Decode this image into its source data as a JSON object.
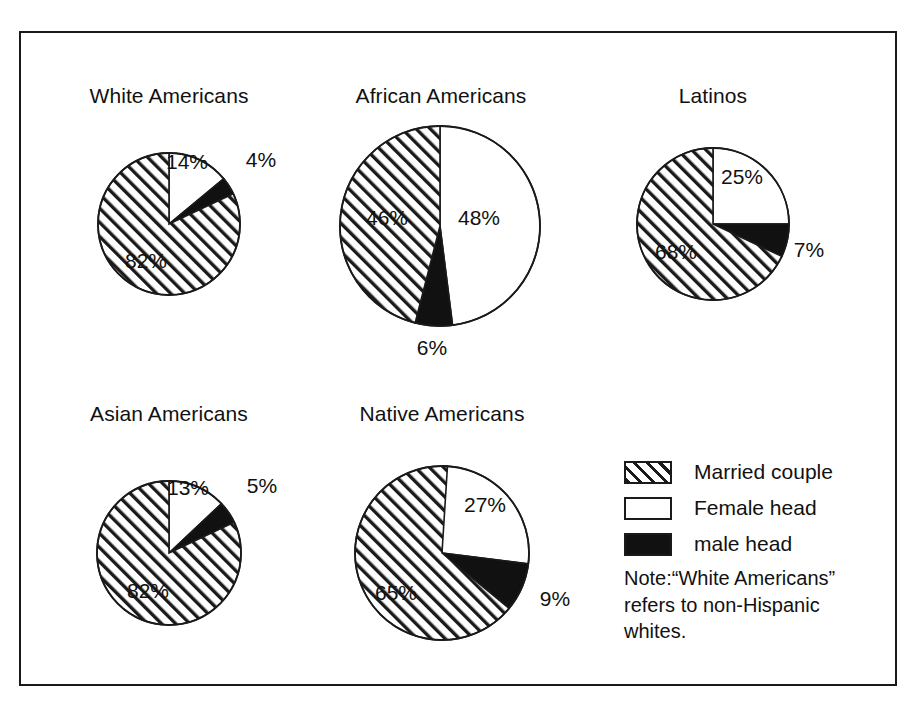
{
  "figure": {
    "background_color": "#ffffff",
    "frame_color": "#1a1a1a"
  },
  "legend": {
    "items": [
      {
        "label": "Married couple",
        "swatch": "hatch",
        "color": "#ffffff"
      },
      {
        "label": "Female head",
        "swatch": "white",
        "color": "#ffffff"
      },
      {
        "label": "male head",
        "swatch": "black",
        "color": "#111111"
      }
    ]
  },
  "note": {
    "text": "Note:“White Americans” refers to non-Hispanic whites."
  },
  "chart_data": {
    "type": "pie",
    "categories": [
      "Married couple",
      "Female head",
      "male head"
    ],
    "legend_position": "bottom-right",
    "units": "percent",
    "charts": [
      {
        "title": "White Americans",
        "values": [
          82,
          14,
          4
        ],
        "labels": [
          "82%",
          "14%",
          "4%"
        ],
        "slices": [
          {
            "name": "Female head",
            "value": 14,
            "label": "14%",
            "fill": "white"
          },
          {
            "name": "male head",
            "value": 4,
            "label": "4%",
            "fill": "black"
          },
          {
            "name": "Married couple",
            "value": 82,
            "label": "82%",
            "fill": "hatch"
          }
        ]
      },
      {
        "title": "African Americans",
        "values": [
          46,
          48,
          6
        ],
        "labels": [
          "46%",
          "48%",
          "6%"
        ],
        "slices": [
          {
            "name": "Female head",
            "value": 48,
            "label": "48%",
            "fill": "white"
          },
          {
            "name": "male head",
            "value": 6,
            "label": "6%",
            "fill": "black"
          },
          {
            "name": "Married couple",
            "value": 46,
            "label": "46%",
            "fill": "hatch"
          }
        ]
      },
      {
        "title": "Latinos",
        "values": [
          68,
          25,
          7
        ],
        "labels": [
          "68%",
          "25%",
          "7%"
        ],
        "slices": [
          {
            "name": "Female head",
            "value": 25,
            "label": "25%",
            "fill": "white"
          },
          {
            "name": "male head",
            "value": 7,
            "label": "7%",
            "fill": "black"
          },
          {
            "name": "Married couple",
            "value": 68,
            "label": "68%",
            "fill": "hatch"
          }
        ]
      },
      {
        "title": "Asian Americans",
        "values": [
          82,
          13,
          5
        ],
        "labels": [
          "82%",
          "13%",
          "5%"
        ],
        "slices": [
          {
            "name": "Female head",
            "value": 13,
            "label": "13%",
            "fill": "white"
          },
          {
            "name": "male head",
            "value": 5,
            "label": "5%",
            "fill": "black"
          },
          {
            "name": "Married couple",
            "value": 82,
            "label": "82%",
            "fill": "hatch"
          }
        ]
      },
      {
        "title": "Native Americans",
        "values": [
          65,
          27,
          9
        ],
        "labels": [
          "65%",
          "27%",
          "9%"
        ],
        "slices": [
          {
            "name": "Female head",
            "value": 27,
            "label": "27%",
            "fill": "white"
          },
          {
            "name": "male head",
            "value": 9,
            "label": "9%",
            "fill": "black"
          },
          {
            "name": "Married couple",
            "value": 65,
            "label": "65%",
            "fill": "hatch"
          }
        ]
      }
    ]
  },
  "layout": {
    "pies": [
      {
        "cx": 167,
        "cy": 222,
        "r": 71,
        "title_y": 82,
        "label_pos": [
          {
            "x": 185,
            "y": 160
          },
          {
            "x": 259,
            "y": 158
          },
          {
            "x": 144,
            "y": 259
          }
        ]
      },
      {
        "cx": 438,
        "cy": 224,
        "r": 100,
        "title_y": 82,
        "label_pos": [
          {
            "x": 477,
            "y": 216
          },
          {
            "x": 430,
            "y": 346
          },
          {
            "x": 385,
            "y": 216
          }
        ]
      },
      {
        "cx": 711,
        "cy": 222,
        "r": 76,
        "title_y": 82,
        "label_pos": [
          {
            "x": 740,
            "y": 175
          },
          {
            "x": 807,
            "y": 248
          },
          {
            "x": 674,
            "y": 250
          }
        ]
      },
      {
        "cx": 167,
        "cy": 551,
        "r": 72,
        "title_y": 400,
        "label_pos": [
          {
            "x": 186,
            "y": 486
          },
          {
            "x": 260,
            "y": 484
          },
          {
            "x": 146,
            "y": 589
          }
        ]
      },
      {
        "cx": 440,
        "cy": 551,
        "r": 87,
        "title_y": 400,
        "label_pos": [
          {
            "x": 483,
            "y": 503
          },
          {
            "x": 553,
            "y": 597
          },
          {
            "x": 394,
            "y": 591
          }
        ]
      }
    ],
    "legend": {
      "x": 624,
      "y": 452
    },
    "note": {
      "x": 624,
      "y": 563
    }
  }
}
